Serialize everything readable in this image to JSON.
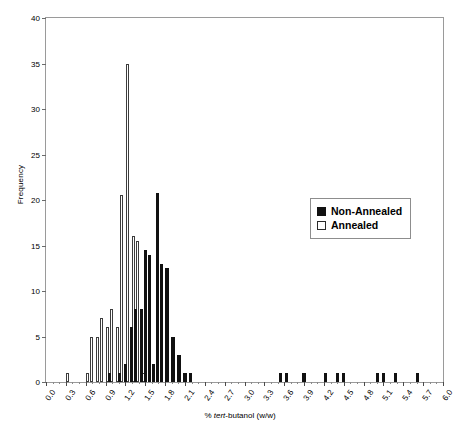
{
  "chart_data": {
    "type": "bar",
    "title": "",
    "subtitle": "",
    "xlabel_prefix": "% ",
    "xlabel_italic": "tert",
    "xlabel_suffix": "-butanol (w/w)",
    "xlabel": "% tert-butanol (w/w)",
    "ylabel": "Frequency",
    "xlim": [
      0.0,
      6.0
    ],
    "ylim": [
      0,
      40
    ],
    "ytick_step": 5,
    "xtick_step": 0.3,
    "grid": false,
    "legend_position": "center-right",
    "ytick_labels": [
      "0",
      "5",
      "10",
      "15",
      "20",
      "25",
      "30",
      "35",
      "40"
    ],
    "xtick_labels": [
      "0.0",
      "0.3",
      "0.6",
      "0.9",
      "1.2",
      "1.5",
      "1.8",
      "2.1",
      "2.4",
      "2.7",
      "3.0",
      "3.3",
      "3.6",
      "3.9",
      "4.2",
      "4.5",
      "4.8",
      "5.1",
      "5.4",
      "5.7",
      "6.0"
    ],
    "series": [
      {
        "name": "Annealed",
        "color": "#ffffff",
        "edge_color": "#3d3d3d",
        "points": [
          {
            "x": 0.33,
            "y": 1
          },
          {
            "x": 0.63,
            "y": 1
          },
          {
            "x": 0.69,
            "y": 5
          },
          {
            "x": 0.78,
            "y": 5
          },
          {
            "x": 0.84,
            "y": 7
          },
          {
            "x": 0.93,
            "y": 6
          },
          {
            "x": 0.99,
            "y": 8
          },
          {
            "x": 1.08,
            "y": 6
          },
          {
            "x": 1.14,
            "y": 20.5
          },
          {
            "x": 1.23,
            "y": 35
          },
          {
            "x": 1.32,
            "y": 16
          },
          {
            "x": 1.38,
            "y": 15.5
          },
          {
            "x": 1.47,
            "y": 1
          },
          {
            "x": 1.56,
            "y": 1
          }
        ]
      },
      {
        "name": "Non-Annealed",
        "color": "#111111",
        "edge_color": "#111111",
        "points": [
          {
            "x": 0.96,
            "y": 1
          },
          {
            "x": 1.11,
            "y": 1
          },
          {
            "x": 1.2,
            "y": 2
          },
          {
            "x": 1.29,
            "y": 6
          },
          {
            "x": 1.35,
            "y": 8
          },
          {
            "x": 1.44,
            "y": 8
          },
          {
            "x": 1.5,
            "y": 14.5
          },
          {
            "x": 1.56,
            "y": 14
          },
          {
            "x": 1.62,
            "y": 2
          },
          {
            "x": 1.68,
            "y": 20.8
          },
          {
            "x": 1.74,
            "y": 13
          },
          {
            "x": 1.83,
            "y": 12.5
          },
          {
            "x": 1.92,
            "y": 5
          },
          {
            "x": 2.01,
            "y": 3
          },
          {
            "x": 2.1,
            "y": 1
          },
          {
            "x": 2.19,
            "y": 1
          },
          {
            "x": 3.54,
            "y": 1
          },
          {
            "x": 3.63,
            "y": 1
          },
          {
            "x": 3.9,
            "y": 1
          },
          {
            "x": 4.23,
            "y": 1
          },
          {
            "x": 4.41,
            "y": 1
          },
          {
            "x": 4.5,
            "y": 1
          },
          {
            "x": 5.01,
            "y": 1
          },
          {
            "x": 5.1,
            "y": 1
          },
          {
            "x": 5.28,
            "y": 1
          },
          {
            "x": 5.61,
            "y": 1
          }
        ]
      }
    ]
  },
  "legend": {
    "items": [
      {
        "label": "Non-Annealed",
        "swatch": "filled"
      },
      {
        "label": "Annealed",
        "swatch": "hollow"
      }
    ]
  }
}
